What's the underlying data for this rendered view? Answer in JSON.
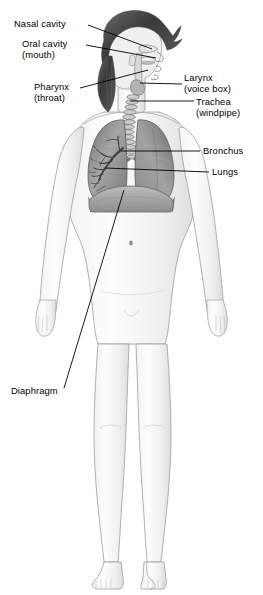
{
  "figure": {
    "style": "grayscale pencil medical illustration",
    "background_color": "#ffffff",
    "line_color": "#000000",
    "width": 263,
    "height": 595
  },
  "labels": [
    {
      "id": "nasal-cavity",
      "text": "Nasal cavity",
      "text2": "",
      "side": "left",
      "x": 14,
      "y": 19,
      "leader": [
        [
          88,
          25
        ],
        [
          152,
          49
        ]
      ]
    },
    {
      "id": "oral-cavity",
      "text": "Oral cavity",
      "text2": "(mouth)",
      "side": "left",
      "x": 22,
      "y": 39,
      "leader": [
        [
          86,
          45
        ],
        [
          156,
          58
        ]
      ]
    },
    {
      "id": "pharynx",
      "text": "Pharynx",
      "text2": "(throat)",
      "side": "left",
      "x": 34,
      "y": 82,
      "leader": [
        [
          80,
          88
        ],
        [
          148,
          70
        ]
      ]
    },
    {
      "id": "larynx",
      "text": "Larynx",
      "text2": "(voice box)",
      "side": "right",
      "x": 184,
      "y": 73,
      "leader": [
        [
          182,
          84
        ],
        [
          140,
          83
        ]
      ]
    },
    {
      "id": "trachea",
      "text": "Trachea",
      "text2": "(windpipe)",
      "side": "right",
      "x": 196,
      "y": 97,
      "leader": [
        [
          194,
          101
        ],
        [
          130,
          101
        ]
      ]
    },
    {
      "id": "bronchus",
      "text": "Bronchus",
      "text2": "",
      "side": "right",
      "x": 203,
      "y": 146,
      "leader": [
        [
          200,
          151
        ],
        [
          121,
          151
        ]
      ]
    },
    {
      "id": "lungs",
      "text": "Lungs",
      "text2": "",
      "side": "right",
      "x": 212,
      "y": 167,
      "leader": [
        [
          209,
          172
        ],
        [
          105,
          168
        ]
      ]
    },
    {
      "id": "diaphragm",
      "text": "Diaphragm",
      "text2": "",
      "side": "left",
      "x": 11,
      "y": 386,
      "leader": [
        [
          64,
          388
        ],
        [
          124,
          190
        ]
      ]
    }
  ],
  "anatomy": {
    "organs": [
      "nasal cavity",
      "oral cavity",
      "pharynx",
      "larynx",
      "trachea",
      "bronchus",
      "right lung",
      "left lung",
      "diaphragm"
    ],
    "trachea_rings": 13,
    "lung_fill": "#9a9a9a",
    "body_outline": "#9d9d9d",
    "hair_color": "#4a4a4a"
  }
}
